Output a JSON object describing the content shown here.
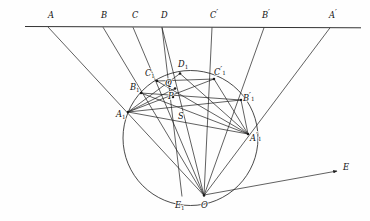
{
  "figure": {
    "background_color": "#fefefe",
    "ink_color": "#1c1c1c",
    "baseline": {
      "name": "horizontal-transversal-line",
      "x1": 25,
      "y1": 26.5,
      "x2": 361,
      "y2": 27.8
    },
    "circle": {
      "name": "main-circle",
      "cx": 190.5,
      "cy": 138.0,
      "r": 67.5
    },
    "ray_to_E": {
      "name": "ray-O-to-E",
      "x1": 204.0,
      "y1": 195.0,
      "x2": 337.0,
      "y2": 171.0,
      "arrow": true
    },
    "points": [
      {
        "id": "A",
        "label": "A",
        "prime": false,
        "sub": "",
        "x": 48.0,
        "y": 27.0,
        "label_x": 48.0,
        "label_y": 18.0,
        "dot": false
      },
      {
        "id": "B",
        "label": "B",
        "prime": false,
        "sub": "",
        "x": 103.0,
        "y": 27.2,
        "label_x": 101.0,
        "label_y": 18.0,
        "dot": false
      },
      {
        "id": "C",
        "label": "C",
        "prime": false,
        "sub": "",
        "x": 133.0,
        "y": 27.3,
        "label_x": 132.0,
        "label_y": 18.0,
        "dot": false
      },
      {
        "id": "D",
        "label": "D",
        "prime": false,
        "sub": "",
        "x": 162.0,
        "y": 27.4,
        "label_x": 161.0,
        "label_y": 18.0,
        "dot": false
      },
      {
        "id": "Cp",
        "label": "C",
        "prime": true,
        "sub": "",
        "x": 212.0,
        "y": 27.5,
        "label_x": 210.0,
        "label_y": 18.0,
        "dot": false
      },
      {
        "id": "Bp",
        "label": "B",
        "prime": true,
        "sub": "",
        "x": 264.0,
        "y": 27.7,
        "label_x": 262.0,
        "label_y": 18.0,
        "dot": false
      },
      {
        "id": "Ap",
        "label": "A",
        "prime": true,
        "sub": "",
        "x": 330.0,
        "y": 27.8,
        "label_x": 329.0,
        "label_y": 18.0,
        "dot": false
      },
      {
        "id": "A1",
        "label": "A",
        "prime": false,
        "sub": "1",
        "x": 128.0,
        "y": 112.0,
        "label_x": 116.0,
        "label_y": 117.0,
        "dot": true
      },
      {
        "id": "B1",
        "label": "B",
        "prime": false,
        "sub": "1",
        "x": 141.0,
        "y": 93.0,
        "label_x": 130.0,
        "label_y": 90.0,
        "dot": true
      },
      {
        "id": "C1",
        "label": "C",
        "prime": false,
        "sub": "1",
        "x": 157.0,
        "y": 81.0,
        "label_x": 145.0,
        "label_y": 76.0,
        "dot": true
      },
      {
        "id": "D1",
        "label": "D",
        "prime": false,
        "sub": "1",
        "x": 180.0,
        "y": 73.5,
        "label_x": 178.0,
        "label_y": 67.0,
        "dot": true
      },
      {
        "id": "C1p",
        "label": "C",
        "prime": true,
        "sub": "1",
        "x": 214.0,
        "y": 79.0,
        "label_x": 214.0,
        "label_y": 75.0,
        "dot": true
      },
      {
        "id": "B1p",
        "label": "B",
        "prime": true,
        "sub": "1",
        "x": 241.0,
        "y": 100.0,
        "label_x": 243.0,
        "label_y": 101.0,
        "dot": true
      },
      {
        "id": "A1p",
        "label": "A",
        "prime": true,
        "sub": "1",
        "x": 248.0,
        "y": 134.0,
        "label_x": 250.0,
        "label_y": 141.0,
        "dot": true
      },
      {
        "id": "E1",
        "label": "E",
        "prime": false,
        "sub": "1",
        "x": 182.0,
        "y": 196.5,
        "label_x": 175.0,
        "label_y": 208.0,
        "dot": false
      },
      {
        "id": "O",
        "label": "O",
        "prime": false,
        "sub": "",
        "x": 204.0,
        "y": 195.5,
        "label_x": 201.0,
        "label_y": 208.0,
        "dot": true
      },
      {
        "id": "E",
        "label": "E",
        "prime": false,
        "sub": "",
        "x": 337.0,
        "y": 171.0,
        "label_x": 343.0,
        "label_y": 170.0,
        "dot": false
      },
      {
        "id": "P",
        "label": "P",
        "prime": false,
        "sub": "",
        "x": 173.0,
        "y": 97.0,
        "label_x": 168.0,
        "label_y": 99.0,
        "dot": true
      },
      {
        "id": "Q",
        "label": "Q",
        "prime": false,
        "sub": "",
        "x": 175.0,
        "y": 88.5,
        "label_x": 165.0,
        "label_y": 86.0,
        "dot": true
      },
      {
        "id": "S",
        "label": "S",
        "prime": false,
        "sub": "",
        "x": 183.0,
        "y": 117.0,
        "label_x": 178.0,
        "label_y": 119.0,
        "dot": false
      }
    ],
    "segments": [
      {
        "name": "ray-A-to-O",
        "from": "A",
        "to": "O"
      },
      {
        "name": "ray-B-to-O",
        "from": "B",
        "to": "O"
      },
      {
        "name": "ray-C-to-O",
        "from": "C",
        "to": "O"
      },
      {
        "name": "ray-D-to-O",
        "from": "D",
        "to": "O"
      },
      {
        "name": "ray-Cprime-to-O",
        "from": "Cp",
        "to": "O"
      },
      {
        "name": "ray-Bprime-to-O",
        "from": "Bp",
        "to": "O"
      },
      {
        "name": "ray-Aprime-to-O",
        "from": "Ap",
        "to": "O"
      },
      {
        "name": "chord-E1-to-D",
        "from": "E1",
        "to": "D"
      },
      {
        "name": "chord-A1-to-B1p",
        "from": "A1",
        "to": "B1p"
      },
      {
        "name": "chord-A1-to-C1p",
        "from": "A1",
        "to": "C1p"
      },
      {
        "name": "chord-A1-to-A1p",
        "from": "A1",
        "to": "A1p"
      },
      {
        "name": "chord-A1-to-D1",
        "from": "A1",
        "to": "D1"
      },
      {
        "name": "chord-A1-to-Q",
        "from": "A1",
        "to": "Q"
      },
      {
        "name": "chord-B1-to-A1p",
        "from": "B1",
        "to": "A1p"
      },
      {
        "name": "chord-B1-to-B1p",
        "from": "B1",
        "to": "B1p"
      },
      {
        "name": "chord-C1-to-A1p",
        "from": "C1",
        "to": "A1p"
      },
      {
        "name": "chord-C1-to-C1p",
        "from": "C1",
        "to": "C1p"
      },
      {
        "name": "chord-D1-to-A1p",
        "from": "D1",
        "to": "A1p"
      },
      {
        "name": "chord-C1p-to-A1p",
        "from": "C1p",
        "to": "A1p"
      },
      {
        "name": "chord-B1p-to-A1p",
        "from": "B1p",
        "to": "A1p"
      }
    ],
    "labels_note": "Italic serif point labels with numeric subscripts and prime marks"
  }
}
